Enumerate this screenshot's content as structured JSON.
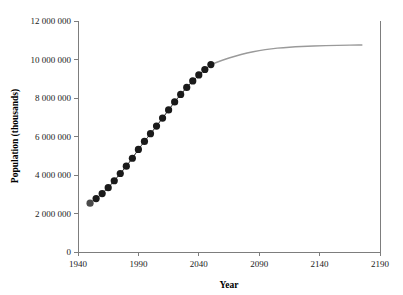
{
  "chart_data": {
    "type": "scatter",
    "title": "",
    "xlabel": "Year",
    "ylabel": "Population (thousands)",
    "xlim": [
      1940,
      2190
    ],
    "ylim": [
      0,
      12000000
    ],
    "xticks": [
      1940,
      1990,
      2040,
      2090,
      2140,
      2190
    ],
    "xtick_labels": [
      "1940",
      "1990",
      "2040",
      "2090",
      "2140",
      "2190"
    ],
    "yticks": [
      0,
      2000000,
      4000000,
      6000000,
      8000000,
      10000000,
      12000000
    ],
    "ytick_labels": [
      "0",
      "2 000 000",
      "4 000 000",
      "6 000 000",
      "8 000 000",
      "10 000 000",
      "12 000 000"
    ],
    "grid": false,
    "legend": "none",
    "series": [
      {
        "name": "Observed and estimated population",
        "style": "markers",
        "marker": "filled-circle",
        "color": "#1a1a1a",
        "x": [
          1950,
          1955,
          1960,
          1965,
          1970,
          1975,
          1980,
          1985,
          1990,
          1995,
          2000,
          2005,
          2010,
          2015,
          2020,
          2025,
          2030,
          2035,
          2040,
          2045,
          2050
        ],
        "values": [
          2536000,
          2773000,
          3035000,
          3340000,
          3701000,
          4079000,
          4458000,
          4871000,
          5327000,
          5744000,
          6145000,
          6542000,
          6957000,
          7379000,
          7795000,
          8184000,
          8549000,
          8888000,
          9199000,
          9481000,
          9735000
        ]
      },
      {
        "name": "Projected population",
        "style": "line",
        "color": "#9a9a9a",
        "x": [
          2050,
          2060,
          2070,
          2080,
          2090,
          2100,
          2110,
          2120,
          2130,
          2140,
          2150,
          2160,
          2170,
          2175
        ],
        "values": [
          9735000,
          9980000,
          10180000,
          10340000,
          10460000,
          10560000,
          10620000,
          10660000,
          10690000,
          10710000,
          10730000,
          10740000,
          10750000,
          10755000
        ]
      }
    ],
    "annotations": []
  },
  "axes": {
    "x_title": "Year",
    "y_title": "Population (thousands)"
  },
  "colors": {
    "observed_marker": "#1a1a1a",
    "projection_line": "#9a9a9a",
    "axis": "#7d7d7d",
    "text": "#1a1a1a",
    "background": "#ffffff"
  }
}
